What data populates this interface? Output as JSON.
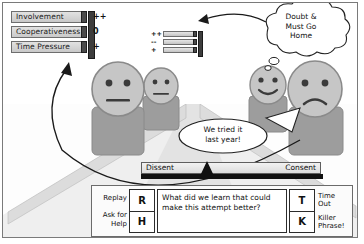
{
  "scene": {
    "title": "Meeting simulation scene",
    "floor_label": "meeting-table-floor"
  },
  "control_panel": {
    "name": "parameter-sliders",
    "sliders": [
      {
        "label": "Involvement",
        "mark": "++"
      },
      {
        "label": "Cooperativeness",
        "mark": "0"
      },
      {
        "label": "Time Pressure",
        "mark": "+"
      }
    ]
  },
  "control_panel_small": {
    "name": "secondary-parameter-sliders",
    "marks": [
      "++",
      "--",
      "+"
    ]
  },
  "thought_bubble": {
    "name": "doubt-thought-bubble",
    "text": "Doubt  &\nMust Go\nHome"
  },
  "speech_bubble": {
    "name": "we-tried-it-speech-bubble",
    "text": "We tried it\nlast year!"
  },
  "consent_bar": {
    "name": "dissent-consent-meter",
    "left_label": "Dissent",
    "right_label": "Consent"
  },
  "toolbar": {
    "left_labels": [
      "Replay",
      "Ask for\nHelp"
    ],
    "left_keys": [
      "R",
      "H"
    ],
    "question": "What did we learn that could make this attempt better?",
    "right_keys": [
      "T",
      "K"
    ],
    "right_labels": [
      "Time\nOut",
      "Killer\nPhrase!"
    ]
  },
  "colors": {
    "border": "#7a7a7a",
    "figure_fill": "#bdbdbd",
    "figure_stroke": "#8a8a8a",
    "body_fill": "#9a9a9a",
    "floor_light": "#ececec",
    "floor_mid": "#d6d6d6",
    "dark": "#111111"
  }
}
